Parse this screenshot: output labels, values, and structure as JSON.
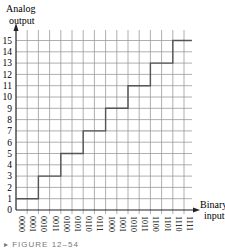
{
  "chart_data": {
    "type": "line",
    "subtype": "step",
    "title": "",
    "xlabel": "Binary input",
    "ylabel": "Analog output",
    "categories": [
      "0000",
      "0001",
      "0010",
      "0011",
      "0100",
      "0101",
      "0110",
      "0111",
      "1000",
      "1001",
      "1010",
      "1011",
      "1100",
      "1101",
      "1110",
      "1111"
    ],
    "y_ticks": [
      0,
      1,
      2,
      3,
      4,
      5,
      6,
      7,
      8,
      9,
      10,
      11,
      12,
      13,
      14,
      15
    ],
    "ylim": [
      0,
      15
    ],
    "grid": true,
    "series": [
      {
        "name": "Analog output",
        "step_points": [
          {
            "x": 0,
            "y": 1
          },
          {
            "x": 2,
            "y": 1
          },
          {
            "x": 2,
            "y": 3
          },
          {
            "x": 4,
            "y": 3
          },
          {
            "x": 4,
            "y": 5
          },
          {
            "x": 6,
            "y": 5
          },
          {
            "x": 6,
            "y": 7
          },
          {
            "x": 8,
            "y": 7
          },
          {
            "x": 8,
            "y": 9
          },
          {
            "x": 10,
            "y": 9
          },
          {
            "x": 10,
            "y": 11
          },
          {
            "x": 12,
            "y": 11
          },
          {
            "x": 12,
            "y": 13
          },
          {
            "x": 14,
            "y": 13
          },
          {
            "x": 14,
            "y": 15
          },
          {
            "x": 15.7,
            "y": 15
          }
        ],
        "values": [
          1,
          1,
          3,
          3,
          5,
          5,
          7,
          7,
          9,
          9,
          11,
          11,
          13,
          13,
          15,
          15
        ]
      }
    ]
  },
  "labels": {
    "y_title_line1": "Analog",
    "y_title_line2": "output",
    "x_title_line1": "Binary",
    "x_title_line2": "input",
    "caption": "▸ FIGURE 12–54"
  }
}
